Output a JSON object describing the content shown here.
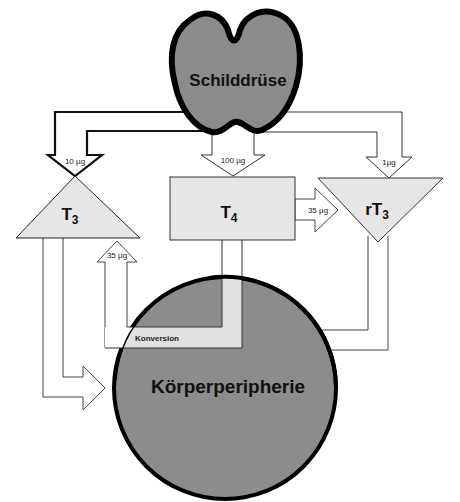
{
  "diagram": {
    "nodes": {
      "thyroid": {
        "label": "Schilddrüse",
        "fill": "#8c8c8c"
      },
      "t3": {
        "label": "T",
        "sub": "3",
        "fill": "#e6e6e6"
      },
      "t4": {
        "label": "T",
        "sub": "4",
        "fill": "#e6e6e6"
      },
      "rt3": {
        "label": "rT",
        "sub": "3",
        "fill": "#e6e6e6"
      },
      "periphery": {
        "label": "Körperperipherie",
        "fill": "#8c8c8c"
      },
      "conversion": {
        "label": "Konversion",
        "fill": "#e6e6e6"
      }
    },
    "edges": [
      {
        "from": "thyroid",
        "to": "t3",
        "label": "10 µg"
      },
      {
        "from": "thyroid",
        "to": "t4",
        "label": "100 µg"
      },
      {
        "from": "thyroid",
        "to": "rt3",
        "label": "1µg"
      },
      {
        "from": "t4",
        "to": "rt3",
        "label": "35 µg"
      },
      {
        "from": "periphery",
        "to": "t3",
        "label": "35 µg",
        "via": "Konversion"
      },
      {
        "from": "t3",
        "to": "periphery",
        "label": ""
      },
      {
        "from": "rt3",
        "to": "periphery",
        "label": ""
      },
      {
        "from": "t4",
        "to": "periphery",
        "label": ""
      }
    ]
  }
}
